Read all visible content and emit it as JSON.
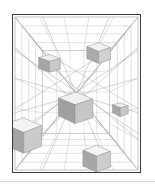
{
  "figure": {
    "frame": {
      "x": 12,
      "y": 14,
      "width": 129,
      "height": 159,
      "border_color": "#3b3b3b",
      "border_width": 1.5,
      "background": "#ffffff"
    },
    "palette": {
      "background": "#ffffff",
      "wireframe_light": "#cfcfcf",
      "wireframe_mid": "#b4b4b4",
      "wireframe_dark": "#9a9a9a",
      "cube_top": "#f1f1f1",
      "cube_left": "#a9a9a9",
      "cube_right": "#cccccc",
      "cube_outline": "#8e8e8e",
      "divider": "#d9d9d9"
    },
    "vanishing_point": {
      "x": 72,
      "y": 74
    },
    "room_box": {
      "outer": {
        "x": 2,
        "y": 2,
        "width": 125,
        "height": 155
      },
      "inner": {
        "x": 28,
        "y": 34,
        "width": 72,
        "height": 88
      }
    },
    "grid": {
      "floor_rows": 6,
      "ceiling_rows": 5,
      "wall_columns": 6,
      "diagonal_count": 18,
      "visible": true
    },
    "cubes": [
      {
        "id": "cube-upper-left",
        "label": "Cube 1",
        "center_x": 39,
        "center_y": 50,
        "size": 17,
        "depth": 7,
        "shade_top": "#eeeeee",
        "shade_left": "#a6a6a6",
        "shade_right": "#c9c9c9"
      },
      {
        "id": "cube-upper-right",
        "label": "Cube 2",
        "center_x": 98,
        "center_y": 42,
        "size": 19,
        "depth": 8,
        "shade_top": "#f2f2f2",
        "shade_left": "#ababab",
        "shade_right": "#d2d2d2"
      },
      {
        "id": "cube-center",
        "label": "Cube 3",
        "center_x": 75,
        "center_y": 96,
        "size": 29,
        "depth": 11,
        "shade_top": "#f0f0f0",
        "shade_left": "#a0a0a0",
        "shade_right": "#c6c6c6"
      },
      {
        "id": "cube-left-large",
        "label": "Cube 4",
        "center_x": 24,
        "center_y": 124,
        "size": 33,
        "depth": 12,
        "shade_top": "#f3f3f3",
        "shade_left": "#a4a4a4",
        "shade_right": "#cbcbcb"
      },
      {
        "id": "cube-right-small",
        "label": "Cube 5",
        "center_x": 120,
        "center_y": 108,
        "size": 13,
        "depth": 6,
        "shade_top": "#ededed",
        "shade_left": "#a8a8a8",
        "shade_right": "#c8c8c8"
      },
      {
        "id": "cube-bottom",
        "label": "Cube 6",
        "center_x": 98,
        "center_y": 160,
        "size": 24,
        "depth": 10,
        "shade_top": "#f4f4f4",
        "shade_left": "#a7a7a7",
        "shade_right": "#cdcdcd"
      }
    ]
  }
}
